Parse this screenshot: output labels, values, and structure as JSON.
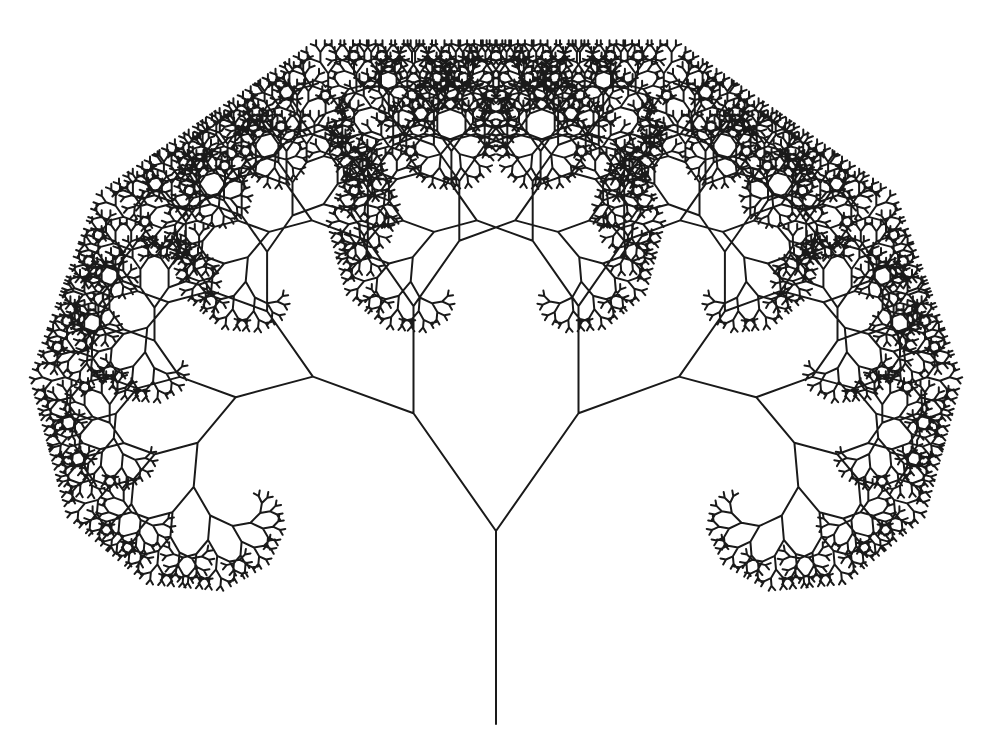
{
  "figure": {
    "title": "Binary fractal tree",
    "background_color": "#ffffff",
    "stroke_color": "#1a1a1a",
    "stroke_width": 2,
    "canvas": {
      "width": 991,
      "height": 751
    }
  },
  "tree": {
    "type": "symmetric-binary-fractal-tree",
    "base": {
      "x": 496,
      "y": 724
    },
    "trunk_length": 193,
    "initial_heading_deg": 0,
    "branch_angle_deg": 35,
    "length_ratio": 0.745,
    "depth": 13
  }
}
